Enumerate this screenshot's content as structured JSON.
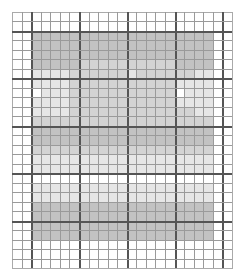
{
  "grid": {
    "columns": 23,
    "rows": 27,
    "thick_every": 5,
    "thick_col_offset": 2,
    "thick_row_offset": 2,
    "line_color": "#9a9a9a",
    "thick_line_color": "#555555"
  },
  "shade_colors": [
    "#ffffff",
    "#e6e6e6",
    "#d3d3d3",
    "#c2c2c2"
  ],
  "shaded_region": {
    "col_start": 2,
    "row_start": 2
  },
  "shade_map": [
    [
      3,
      3,
      3,
      3,
      3,
      3,
      3,
      3,
      3,
      3,
      3,
      3,
      3,
      3,
      3,
      3,
      3,
      3,
      3
    ],
    [
      3,
      3,
      3,
      3,
      3,
      3,
      3,
      3,
      3,
      3,
      3,
      3,
      3,
      3,
      3,
      3,
      3,
      3,
      3
    ],
    [
      3,
      3,
      3,
      3,
      3,
      3,
      3,
      3,
      3,
      3,
      3,
      3,
      3,
      3,
      3,
      3,
      3,
      3,
      3
    ],
    [
      3,
      3,
      3,
      3,
      3,
      2,
      2,
      2,
      2,
      2,
      2,
      2,
      2,
      2,
      2,
      3,
      3,
      3,
      3
    ],
    [
      1,
      1,
      1,
      1,
      2,
      2,
      2,
      2,
      2,
      2,
      1,
      2,
      2,
      2,
      2,
      2,
      2,
      1,
      1
    ],
    [
      1,
      1,
      1,
      1,
      2,
      2,
      2,
      2,
      2,
      2,
      2,
      2,
      2,
      2,
      2,
      1,
      1,
      1,
      1
    ],
    [
      0,
      1,
      1,
      1,
      2,
      2,
      2,
      2,
      2,
      2,
      2,
      2,
      2,
      2,
      2,
      0,
      1,
      1,
      1
    ],
    [
      1,
      1,
      1,
      1,
      2,
      2,
      2,
      2,
      2,
      2,
      2,
      2,
      2,
      2,
      2,
      1,
      1,
      1,
      1
    ],
    [
      1,
      1,
      1,
      1,
      2,
      2,
      2,
      2,
      2,
      2,
      2,
      2,
      2,
      2,
      2,
      2,
      2,
      1,
      1
    ],
    [
      2,
      2,
      2,
      2,
      2,
      2,
      2,
      2,
      2,
      2,
      2,
      2,
      2,
      2,
      2,
      2,
      2,
      2,
      2
    ],
    [
      3,
      3,
      3,
      3,
      3,
      3,
      3,
      3,
      3,
      3,
      3,
      3,
      3,
      3,
      3,
      3,
      3,
      3,
      3
    ],
    [
      3,
      3,
      3,
      3,
      3,
      3,
      3,
      3,
      3,
      3,
      3,
      3,
      3,
      3,
      3,
      3,
      3,
      3,
      3
    ],
    [
      2,
      2,
      2,
      2,
      2,
      2,
      2,
      2,
      2,
      2,
      2,
      2,
      2,
      2,
      2,
      2,
      2,
      2,
      2
    ],
    [
      1,
      1,
      1,
      1,
      1,
      1,
      1,
      1,
      1,
      1,
      1,
      1,
      1,
      1,
      1,
      1,
      1,
      1,
      1
    ],
    [
      1,
      1,
      1,
      1,
      1,
      1,
      1,
      1,
      1,
      1,
      1,
      1,
      1,
      1,
      1,
      1,
      1,
      1,
      1
    ],
    [
      0,
      0,
      0,
      0,
      0,
      0,
      0,
      0,
      0,
      0,
      0,
      0,
      0,
      0,
      0,
      0,
      0,
      0,
      0
    ],
    [
      1,
      1,
      1,
      1,
      1,
      1,
      1,
      1,
      1,
      1,
      1,
      1,
      1,
      1,
      1,
      1,
      1,
      1,
      1
    ],
    [
      1,
      1,
      1,
      1,
      1,
      1,
      1,
      1,
      1,
      1,
      1,
      1,
      1,
      1,
      1,
      1,
      1,
      1,
      1
    ],
    [
      3,
      3,
      3,
      3,
      3,
      3,
      3,
      3,
      3,
      3,
      3,
      3,
      3,
      3,
      3,
      3,
      3,
      3,
      3
    ],
    [
      3,
      3,
      3,
      3,
      3,
      3,
      3,
      3,
      3,
      3,
      3,
      3,
      3,
      3,
      3,
      3,
      3,
      3,
      3
    ],
    [
      3,
      3,
      3,
      3,
      3,
      3,
      3,
      3,
      3,
      3,
      3,
      3,
      3,
      3,
      3,
      3,
      3,
      3,
      3
    ],
    [
      3,
      3,
      3,
      3,
      3,
      3,
      3,
      3,
      3,
      3,
      3,
      3,
      3,
      3,
      3,
      3,
      3,
      3,
      3
    ]
  ]
}
